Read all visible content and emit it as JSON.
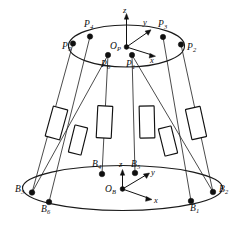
{
  "figure": {
    "stroke_color": "#111111",
    "background_color": "#ffffff",
    "node_color": "#101010"
  },
  "moving_platform": {
    "name": "moving-platform",
    "origin_label": "O",
    "origin_subscript": "P",
    "axes": [
      {
        "name": "z",
        "label": "z"
      },
      {
        "name": "y",
        "label": "y"
      },
      {
        "name": "x",
        "label": "x"
      }
    ],
    "joints": [
      {
        "id": "P1",
        "label": "P",
        "subscript": "1"
      },
      {
        "id": "P2",
        "label": "P",
        "subscript": "2"
      },
      {
        "id": "P3",
        "label": "P",
        "subscript": "3"
      },
      {
        "id": "P4",
        "label": "P",
        "subscript": "4"
      },
      {
        "id": "P5",
        "label": "P",
        "subscript": "5"
      },
      {
        "id": "P6",
        "label": "P",
        "subscript": "6"
      }
    ]
  },
  "base_platform": {
    "name": "base-platform",
    "origin_label": "O",
    "origin_subscript": "B",
    "axes": [
      {
        "name": "z",
        "label": "z"
      },
      {
        "name": "y",
        "label": "y"
      },
      {
        "name": "x",
        "label": "x"
      }
    ],
    "joints": [
      {
        "id": "B1",
        "label": "B",
        "subscript": "1"
      },
      {
        "id": "B2",
        "label": "B",
        "subscript": "2"
      },
      {
        "id": "B3",
        "label": "B",
        "subscript": "3"
      },
      {
        "id": "B4",
        "label": "B",
        "subscript": "4"
      },
      {
        "id": "B5",
        "label": "B",
        "subscript": "5"
      },
      {
        "id": "B6",
        "label": "B",
        "subscript": "6"
      }
    ]
  },
  "legs": {
    "name": "linear-actuators",
    "count": 6
  }
}
